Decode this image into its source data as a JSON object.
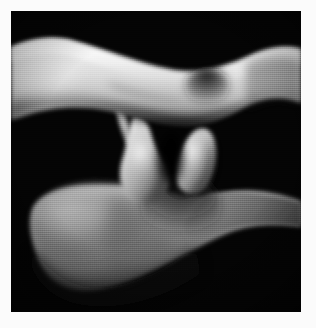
{
  "figure": {
    "alt_text": "3D rendered grayscale anatomical structure on black background",
    "caption": "",
    "border_color": "#fbfbfb",
    "canvas_background": "#040404",
    "canvas": {
      "x": 11,
      "y": 11,
      "width": 290,
      "height": 301
    },
    "palette": {
      "background": "#040404",
      "border": "#fbfbfb",
      "highlight": "#f2f2f2",
      "midtone": "#a8a8a8",
      "shadow": "#3a3a3a",
      "deep_shadow": "#141414"
    },
    "structures": [
      {
        "name": "upper-band",
        "label": "Upper arched band",
        "tone": "bright",
        "notes": "Spans full width, dips at center-right with a notch."
      },
      {
        "name": "left-bulb",
        "label": "Left pendulous body",
        "tone": "bright",
        "notes": "Club / teardrop shape hanging below band midline."
      },
      {
        "name": "right-bulb",
        "label": "Right pendulous body",
        "tone": "bright",
        "notes": "Narrower conical shape beside left body."
      },
      {
        "name": "lower-mass",
        "label": "Lower broad mass",
        "tone": "mid-gray",
        "notes": "Bowl-shaped on the left, tapering to a band exiting right edge."
      }
    ]
  }
}
